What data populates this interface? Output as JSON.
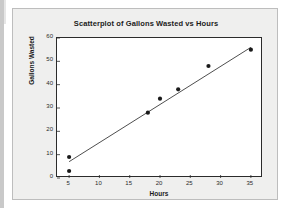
{
  "figure": {
    "title": "Scatterplot of Gallons Wasted vs Hours",
    "panel_bg": "#efefee",
    "plot_bg": "#ffffff",
    "frame_color": "#2b2b2b",
    "marker_color": "#1a1a1a",
    "line_color": "#3a3a3a"
  },
  "chart_data": {
    "type": "scatter",
    "title": "Scatterplot of Gallons Wasted vs Hours",
    "xlabel": "Hours",
    "ylabel": "Gallons Wasted",
    "xlim": [
      3,
      37
    ],
    "ylim": [
      0,
      60
    ],
    "xticks": [
      5,
      10,
      15,
      20,
      25,
      30,
      35
    ],
    "xtick_labels": [
      "5",
      "10",
      "15",
      "20",
      "25",
      "30",
      "35"
    ],
    "yticks": [
      0,
      10,
      20,
      30,
      40,
      50,
      60
    ],
    "ytick_labels": [
      "0",
      "10",
      "20",
      "30",
      "40",
      "50",
      "60"
    ],
    "grid": false,
    "legend": false,
    "series": [
      {
        "name": "Gallons Wasted",
        "marker": "filled-circle",
        "x": [
          5,
          5,
          18,
          20,
          23,
          28,
          35
        ],
        "y": [
          9,
          3,
          28,
          34,
          38,
          48,
          55
        ]
      }
    ],
    "fit_line": {
      "name": "regression line",
      "x_start": 5,
      "y_start": 7,
      "x_end": 35,
      "y_end": 56
    }
  }
}
